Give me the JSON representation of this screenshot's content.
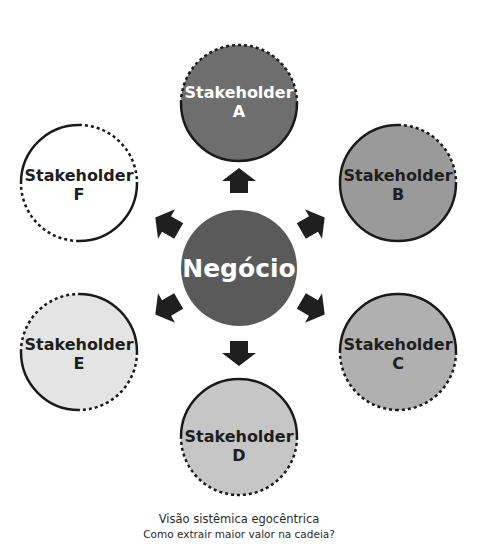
{
  "center": {
    "label": "Negócio",
    "fill": "#5a5a5a",
    "text_color": "#ffffff"
  },
  "stakeholders": [
    {
      "id": "A",
      "line1": "Stakeholder",
      "line2": "A",
      "fill": "#6e6e6e",
      "text_color": "#ffffff"
    },
    {
      "id": "B",
      "line1": "Stakeholder",
      "line2": "B",
      "fill": "#9a9a9a",
      "text_color": "#1e1e1e"
    },
    {
      "id": "C",
      "line1": "Stakeholder",
      "line2": "C",
      "fill": "#b0b0b0",
      "text_color": "#1e1e1e"
    },
    {
      "id": "D",
      "line1": "Stakeholder",
      "line2": "D",
      "fill": "#c6c6c6",
      "text_color": "#1e1e1e"
    },
    {
      "id": "E",
      "line1": "Stakeholder",
      "line2": "E",
      "fill": "#e4e4e4",
      "text_color": "#1e1e1e"
    },
    {
      "id": "F",
      "line1": "Stakeholder",
      "line2": "F",
      "fill": "#ffffff",
      "text_color": "#1e1e1e"
    }
  ],
  "arrow_color": "#1f1f1f",
  "caption": {
    "title": "Visão sistêmica egocêntrica",
    "subtitle": "Como extrair maior valor na cadeia?"
  }
}
